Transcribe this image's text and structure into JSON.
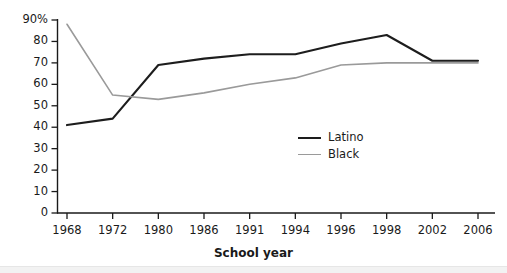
{
  "chart_data": {
    "type": "line",
    "title": "",
    "subtitle": "",
    "xlabel": "School year",
    "ylabel": "",
    "categories": [
      "1968",
      "1972",
      "1980",
      "1986",
      "1991",
      "1994",
      "1996",
      "1998",
      "2002",
      "2006"
    ],
    "x": [
      1968,
      1972,
      1980,
      1986,
      1991,
      1994,
      1996,
      1998,
      2002,
      2006
    ],
    "series": [
      {
        "name": "Latino",
        "color": "#1d1d1d",
        "line_width": 2.1,
        "values": [
          41,
          44,
          69,
          72,
          74,
          74,
          79,
          83,
          71,
          71
        ]
      },
      {
        "name": "Black",
        "color": "#9a9a9a",
        "line_width": 1.6,
        "values": [
          88,
          55,
          53,
          56,
          60,
          63,
          69,
          70,
          70,
          70
        ]
      }
    ],
    "ylim": [
      0,
      90
    ],
    "xlim_categorical": true,
    "y_ticks": [
      0,
      10,
      20,
      30,
      40,
      50,
      60,
      70,
      80,
      90
    ],
    "y_tick_labels": [
      "0",
      "10",
      "20",
      "30",
      "40",
      "50",
      "60",
      "70",
      "80",
      "90%"
    ],
    "grid": false,
    "legend_position": "center-right-inside",
    "axis_color": "#1a1a1a"
  },
  "legend": {
    "items": [
      {
        "label": "Latino"
      },
      {
        "label": "Black"
      }
    ]
  },
  "axes": {
    "x_title": "School year"
  }
}
